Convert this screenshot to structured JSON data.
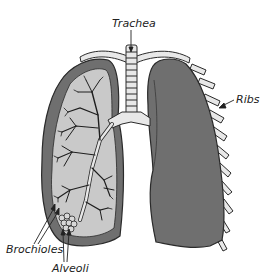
{
  "diagram": {
    "labels": {
      "trachea": "Trachea",
      "ribs": "Ribs",
      "brochioles": "Brochioles",
      "alveoli": "Alveoli"
    },
    "colors": {
      "lung_dark": "#6f6f6f",
      "lung_light": "#c9c9c9",
      "outline": "#2a2a2a",
      "rib_fill": "#e8e8e8",
      "text": "#222222",
      "background": "#ffffff"
    }
  }
}
